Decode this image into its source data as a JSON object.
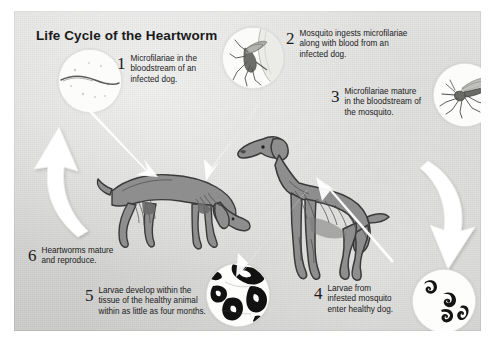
{
  "poster": {
    "title": "Life Cycle of the Heartworm",
    "background_color": "#d9d9d7",
    "text_color": "#1b1b1b",
    "dog_color": "#8f8f8f",
    "arrow_color": "#ffffff"
  },
  "steps": [
    {
      "number": "1",
      "text": "Microfilariae in the\nbloodstream of an\ninfected dog.",
      "illustration": "microfilaria-in-blood-circle"
    },
    {
      "number": "2",
      "text": "Mosquito ingests microfilariae\nalong with blood from an\ninfected dog.",
      "illustration": "mosquito-biting-skin-circle"
    },
    {
      "number": "3",
      "text": "Microfilariae mature\nin the bloodstream of\nthe mosquito.",
      "illustration": "mosquito-circle"
    },
    {
      "number": "4",
      "text": "Larvae from\ninfested mosquito\nenter healthy dog.",
      "illustration": "larvae-circle"
    },
    {
      "number": "5",
      "text": "Larvae develop within the\ntissue of the healthy animal\nwithin as little as four months.",
      "illustration": "tissue-section-circle"
    },
    {
      "number": "6",
      "text": "Heartworms mature\nand reproduce.",
      "illustration": ""
    }
  ],
  "figures": {
    "sick_dog_label": "infected dog with heartworms",
    "healthy_dog_label": "healthy dog",
    "left_arrow_label": "cycle arrow pointing up",
    "right_arrow_label": "cycle arrow pointing down"
  }
}
